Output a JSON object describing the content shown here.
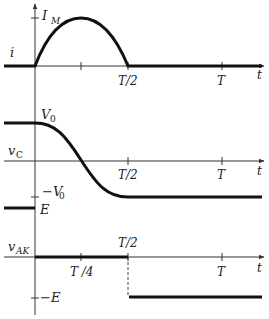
{
  "diagram": {
    "time_axis": {
      "label": "t",
      "ticks": {
        "quarter": "T /4",
        "half": "T/2",
        "full": "T"
      }
    },
    "panels": [
      {
        "id": "current",
        "ylabel": "i",
        "level_labels": {
          "peak": "I",
          "peak_sub": "M"
        },
        "shape": "half-sine pulse from 0 to T/2 peaking at I_M at T/4, zero elsewhere"
      },
      {
        "id": "capacitor-voltage",
        "ylabel": "v",
        "ylabel_sub": "C",
        "level_labels": {
          "pos": "V",
          "pos_sub": "0",
          "neg": "−V",
          "neg_sub": "0"
        },
        "shape": "V0 for t<0, cosine fall from V0 to -V0 over 0..T/2, -V0 after"
      },
      {
        "id": "thyristor-voltage",
        "ylabel": "v",
        "ylabel_sub": "AK",
        "level_labels": {
          "pos": "E",
          "neg": "−E"
        },
        "shape": "E for t<0, 0 from 0 to T/2, step to -E at T/2 (dashed transition)"
      }
    ],
    "colors": {
      "trace": "#111111",
      "axis": "#333333",
      "background": "#ffffff"
    }
  }
}
